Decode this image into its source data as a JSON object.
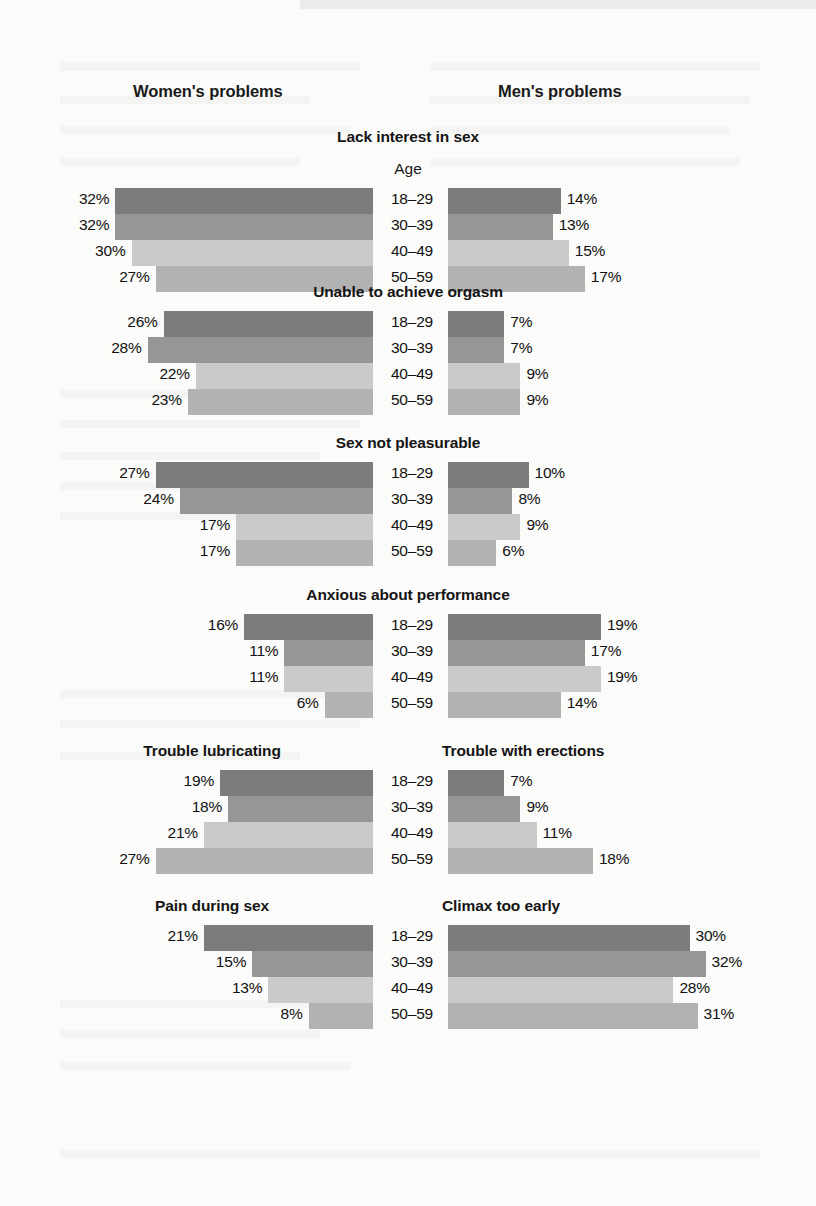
{
  "header": {
    "women_label": "Women's problems",
    "men_label": "Men's problems",
    "age_label": "Age"
  },
  "colors": {
    "age_18_29": "#7c7c7c",
    "age_30_39": "#969696",
    "age_40_49": "#cacaca",
    "age_50_59": "#b2b2b2",
    "text": "#111111",
    "background": "#fbfbfa"
  },
  "chart_data": {
    "type": "bar",
    "subtitle": "",
    "xlabel": "",
    "ylabel": "Age",
    "orientation": "horizontal-diverging",
    "categories": [
      "18–29",
      "30–39",
      "40–49",
      "50–59"
    ],
    "legend_position": "none",
    "grid": false,
    "xlim": [
      0,
      35
    ],
    "units": "percent",
    "panel_headers": [
      "Women's problems",
      "Men's problems"
    ],
    "panels": [
      {
        "title": "Lack interest in sex",
        "title_left": "",
        "title_right": "",
        "shared_title": true,
        "series": [
          {
            "name": "Women",
            "side": "left",
            "values": [
              32,
              32,
              30,
              27
            ],
            "labels": [
              "32%",
              "32%",
              "30%",
              "27%"
            ]
          },
          {
            "name": "Men",
            "side": "right",
            "values": [
              14,
              13,
              15,
              17
            ],
            "labels": [
              "14%",
              "13%",
              "15%",
              "17%"
            ]
          }
        ]
      },
      {
        "title": "Unable to achieve orgasm",
        "title_left": "",
        "title_right": "",
        "shared_title": true,
        "series": [
          {
            "name": "Women",
            "side": "left",
            "values": [
              26,
              28,
              22,
              23
            ],
            "labels": [
              "26%",
              "28%",
              "22%",
              "23%"
            ]
          },
          {
            "name": "Men",
            "side": "right",
            "values": [
              7,
              7,
              9,
              9
            ],
            "labels": [
              "7%",
              "7%",
              "9%",
              "9%"
            ]
          }
        ]
      },
      {
        "title": "Sex not pleasurable",
        "title_left": "",
        "title_right": "",
        "shared_title": true,
        "series": [
          {
            "name": "Women",
            "side": "left",
            "values": [
              27,
              24,
              17,
              17
            ],
            "labels": [
              "27%",
              "24%",
              "17%",
              "17%"
            ]
          },
          {
            "name": "Men",
            "side": "right",
            "values": [
              10,
              8,
              9,
              6
            ],
            "labels": [
              "10%",
              "8%",
              "9%",
              "6%"
            ]
          }
        ]
      },
      {
        "title": "Anxious about performance",
        "title_left": "",
        "title_right": "",
        "shared_title": true,
        "series": [
          {
            "name": "Women",
            "side": "left",
            "values": [
              16,
              11,
              11,
              6
            ],
            "labels": [
              "16%",
              "11%",
              "11%",
              "6%"
            ]
          },
          {
            "name": "Men",
            "side": "right",
            "values": [
              19,
              17,
              19,
              14
            ],
            "labels": [
              "19%",
              "17%",
              "19%",
              "14%"
            ]
          }
        ]
      },
      {
        "title": "",
        "title_left": "Trouble lubricating",
        "title_right": "Trouble with erections",
        "shared_title": false,
        "series": [
          {
            "name": "Women",
            "side": "left",
            "values": [
              19,
              18,
              21,
              27
            ],
            "labels": [
              "19%",
              "18%",
              "21%",
              "27%"
            ]
          },
          {
            "name": "Men",
            "side": "right",
            "values": [
              7,
              9,
              11,
              18
            ],
            "labels": [
              "7%",
              "9%",
              "11%",
              "18%"
            ]
          }
        ]
      },
      {
        "title": "",
        "title_left": "Pain during sex",
        "title_right": "Climax too early",
        "shared_title": false,
        "series": [
          {
            "name": "Women",
            "side": "left",
            "values": [
              21,
              15,
              13,
              8
            ],
            "labels": [
              "21%",
              "15%",
              "13%",
              "8%"
            ]
          },
          {
            "name": "Men",
            "side": "right",
            "values": [
              30,
              32,
              28,
              31
            ],
            "labels": [
              "30%",
              "32%",
              "28%",
              "31%"
            ]
          }
        ]
      }
    ]
  }
}
